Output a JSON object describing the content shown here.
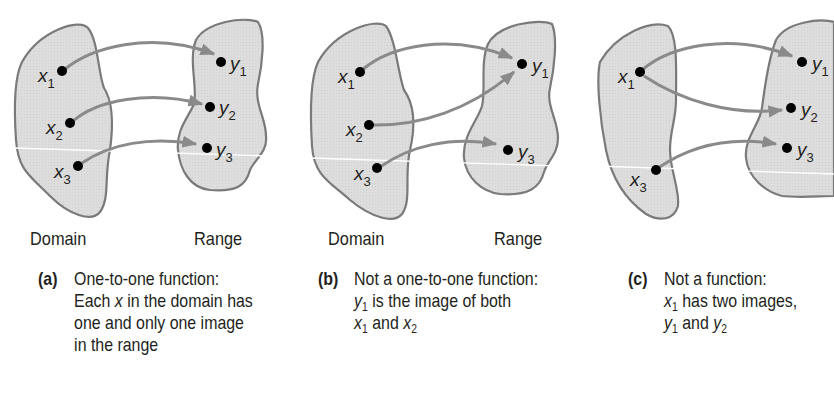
{
  "figure": {
    "colors": {
      "set_fill": "#dcdcdc",
      "set_stroke": "#7a7a7a",
      "arrow": "#8a8a8a",
      "dot": "#000000",
      "text": "#231f20"
    },
    "panels": [
      {
        "id": "a",
        "domain_label": "Domain",
        "range_label": "Range",
        "domain_points": [
          "x1",
          "x2",
          "x3"
        ],
        "range_points": [
          "y1",
          "y2",
          "y3"
        ],
        "mappings": [
          [
            "x1",
            "y1"
          ],
          [
            "x2",
            "y2"
          ],
          [
            "x3",
            "y3"
          ]
        ],
        "caption": {
          "tag": "(a)",
          "lines": [
            "One-to-one function:",
            "Each x in the domain has",
            "one and only one image",
            "in the range"
          ]
        }
      },
      {
        "id": "b",
        "domain_label": "Domain",
        "range_label": "Range",
        "domain_points": [
          "x1",
          "x2",
          "x3"
        ],
        "range_points": [
          "y1",
          "y3"
        ],
        "mappings": [
          [
            "x1",
            "y1"
          ],
          [
            "x2",
            "y1"
          ],
          [
            "x3",
            "y3"
          ]
        ],
        "caption": {
          "tag": "(b)",
          "lines": [
            "Not a one-to-one function:",
            "y1 is the image of both",
            "x1 and x2"
          ]
        }
      },
      {
        "id": "c",
        "domain_label": "",
        "range_label": "",
        "domain_points": [
          "x1",
          "x3"
        ],
        "range_points": [
          "y1",
          "y2",
          "y3"
        ],
        "mappings": [
          [
            "x1",
            "y1"
          ],
          [
            "x1",
            "y2"
          ],
          [
            "x3",
            "y3"
          ]
        ],
        "caption": {
          "tag": "(c)",
          "lines": [
            "Not a function:",
            "x1 has two images,",
            "y1 and y2"
          ]
        }
      }
    ]
  },
  "text": {
    "a": {
      "domain": "Domain",
      "range": "Range",
      "tag": "(a)",
      "l1": "One-to-one function:",
      "l2_pre": "Each ",
      "l2_var": "x",
      "l2_post": " in the domain has",
      "l3": "one and only one image",
      "l4": "in the range"
    },
    "b": {
      "domain": "Domain",
      "range": "Range",
      "tag": "(b)",
      "l1": "Not a one-to-one function:",
      "l2_var": "y",
      "l2_sub": "1",
      "l2_post": " is the image of both",
      "l3_var1": "x",
      "l3_sub1": "1",
      "l3_mid": " and ",
      "l3_var2": "x",
      "l3_sub2": "2"
    },
    "c": {
      "tag": "(c)",
      "l1": "Not a function:",
      "l2_var": "x",
      "l2_sub": "1",
      "l2_post": " has two images,",
      "l3_var1": "y",
      "l3_sub1": "1",
      "l3_mid": " and ",
      "l3_var2": "y",
      "l3_sub2": "2"
    },
    "pts": {
      "x": "x",
      "y": "y",
      "s1": "1",
      "s2": "2",
      "s3": "3"
    }
  }
}
